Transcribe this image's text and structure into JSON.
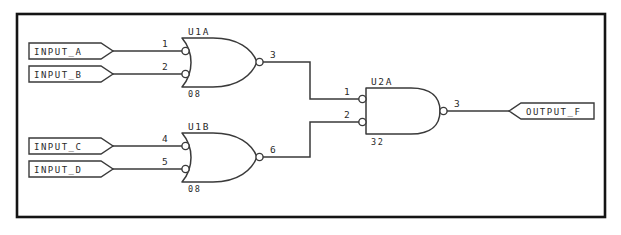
{
  "diagram": {
    "type": "digital-logic-schematic",
    "frame": {
      "stroke_color": "#141414"
    },
    "wire_color": "#3a3a3a",
    "background_color": "#ffffff"
  },
  "input_ports": [
    {
      "id": "input-a",
      "label": "INPUT_A",
      "connects_to_pin": "1"
    },
    {
      "id": "input-b",
      "label": "INPUT_B",
      "connects_to_pin": "2"
    },
    {
      "id": "input-c",
      "label": "INPUT_C",
      "connects_to_pin": "4"
    },
    {
      "id": "input-d",
      "label": "INPUT_D",
      "connects_to_pin": "5"
    }
  ],
  "output_ports": [
    {
      "id": "output-f",
      "label": "OUTPUT_F",
      "connects_to_pin": "3"
    }
  ],
  "gates": [
    {
      "id": "u1a",
      "ref_des": "U1A",
      "part_number": "08",
      "shape": "or",
      "inverted_inputs": true,
      "inverted_output": true,
      "input_pins": [
        "1",
        "2"
      ],
      "output_pin": "3"
    },
    {
      "id": "u1b",
      "ref_des": "U1B",
      "part_number": "08",
      "shape": "or",
      "inverted_inputs": true,
      "inverted_output": true,
      "input_pins": [
        "4",
        "5"
      ],
      "output_pin": "6"
    },
    {
      "id": "u2a",
      "ref_des": "U2A",
      "part_number": "32",
      "shape": "and",
      "inverted_inputs": true,
      "inverted_output": true,
      "input_pins": [
        "1",
        "2"
      ],
      "output_pin": "3"
    }
  ],
  "nets": [
    {
      "id": "net-a",
      "from": "INPUT_A",
      "to": "U1A.1"
    },
    {
      "id": "net-b",
      "from": "INPUT_B",
      "to": "U1A.2"
    },
    {
      "id": "net-c",
      "from": "INPUT_C",
      "to": "U1B.4"
    },
    {
      "id": "net-d",
      "from": "INPUT_D",
      "to": "U1B.5"
    },
    {
      "id": "net-u1a-out",
      "from": "U1A.3",
      "to": "U2A.1"
    },
    {
      "id": "net-u1b-out",
      "from": "U1B.6",
      "to": "U2A.2"
    },
    {
      "id": "net-out",
      "from": "U2A.3",
      "to": "OUTPUT_F"
    }
  ]
}
